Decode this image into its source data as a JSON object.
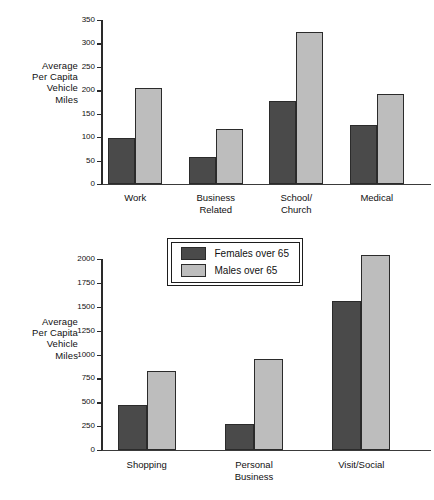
{
  "figure": {
    "background": "#ffffff",
    "series_colors": {
      "females": "#4a4a4a",
      "males": "#bdbdbd"
    },
    "axis_color": "#2a2a2a"
  },
  "legend": {
    "position": "between-charts",
    "entries": [
      {
        "label": "Females over 65",
        "color": "#4a4a4a",
        "key": "females"
      },
      {
        "label": "Males over 65",
        "color": "#bdbdbd",
        "key": "males"
      }
    ]
  },
  "chart_data": [
    {
      "id": "top",
      "type": "bar",
      "title": "",
      "xlabel": "",
      "ylabel": "Average\nPer Capita\nVehicle\nMiles",
      "ylim": [
        0,
        350
      ],
      "ytick_step": 50,
      "yticks": [
        0,
        50,
        100,
        150,
        200,
        250,
        300,
        350
      ],
      "ytick_labels": [
        "0",
        "50",
        "100",
        "150",
        "200",
        "250",
        "300",
        "350"
      ],
      "grid": false,
      "legend_position": "below-chart",
      "categories": [
        "Work",
        "Business\nRelated",
        "School/\nChurch",
        "Medical"
      ],
      "series": [
        {
          "name": "Females over 65",
          "key": "females",
          "values": [
            98,
            57,
            178,
            125
          ]
        },
        {
          "name": "Males over 65",
          "key": "males",
          "values": [
            205,
            118,
            325,
            192
          ]
        }
      ]
    },
    {
      "id": "bottom",
      "type": "bar",
      "title": "",
      "xlabel": "",
      "ylabel": "Average\nPer Capita\nVehicle\nMiles",
      "ylim": [
        0,
        2000
      ],
      "ytick_step": 250,
      "yticks": [
        0,
        250,
        500,
        750,
        1000,
        1250,
        1500,
        1750,
        2000
      ],
      "ytick_labels": [
        "0",
        "250",
        "500",
        "750",
        "1000",
        "1250",
        "1500",
        "1750",
        "2000"
      ],
      "grid": false,
      "legend_position": "above-chart",
      "categories": [
        "Shopping",
        "Personal\nBusiness",
        "Visit/Social"
      ],
      "series": [
        {
          "name": "Females over 65",
          "key": "females",
          "values": [
            470,
            275,
            1560
          ]
        },
        {
          "name": "Males over 65",
          "key": "males",
          "values": [
            830,
            950,
            2040
          ]
        }
      ]
    }
  ]
}
